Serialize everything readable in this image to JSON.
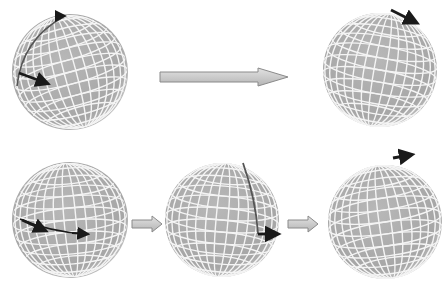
{
  "diagram": {
    "colors": {
      "background": "#ffffff",
      "sphere_fill": "#a9a9a9",
      "grid_lines": "#f4f4f4",
      "vector": "#1a1a1a",
      "path": "#555555",
      "transition_arrow_fill": "#c8c8c8",
      "transition_arrow_stroke": "#8a8a8a"
    },
    "spheres": [
      {
        "id": "top-start",
        "cx": 70,
        "cy": 72,
        "r": 58
      },
      {
        "id": "top-end",
        "cx": 380,
        "cy": 70,
        "r": 57
      },
      {
        "id": "bottom-step1",
        "cx": 70,
        "cy": 220,
        "r": 58
      },
      {
        "id": "bottom-step2",
        "cx": 222,
        "cy": 220,
        "r": 57
      },
      {
        "id": "bottom-end",
        "cx": 385,
        "cy": 222,
        "r": 57
      }
    ],
    "transition_arrows": [
      {
        "id": "top-arrow",
        "x1": 160,
        "x2": 288,
        "y": 76,
        "size": "large"
      },
      {
        "id": "bottom-arrow-1",
        "x1": 132,
        "x2": 162,
        "y": 224,
        "size": "small"
      },
      {
        "id": "bottom-arrow-2",
        "x1": 288,
        "x2": 318,
        "y": 224,
        "size": "small"
      }
    ]
  }
}
